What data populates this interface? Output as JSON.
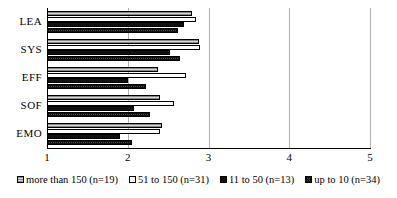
{
  "chart_data": {
    "type": "bar",
    "orientation": "horizontal",
    "title": "",
    "xlabel": "",
    "ylabel": "",
    "xlim": [
      1,
      5
    ],
    "xticks": [
      "1",
      "2",
      "3",
      "4",
      "5"
    ],
    "grid": true,
    "legend_position": "bottom",
    "categories": [
      "LEA",
      "SYS",
      "EFF",
      "SOF",
      "EMO"
    ],
    "series": [
      {
        "name": "more than 150 (n=19)",
        "pattern": "light-grey-hatch",
        "values": [
          2.8,
          2.88,
          2.38,
          2.4,
          2.42
        ]
      },
      {
        "name": "51 to 150 (n=31)",
        "pattern": "white",
        "values": [
          2.85,
          2.9,
          2.72,
          2.57,
          2.4
        ]
      },
      {
        "name": "11 to 50 (n=13)",
        "pattern": "solid-black",
        "values": [
          2.7,
          2.52,
          2.0,
          2.08,
          1.9
        ]
      },
      {
        "name": "up to 10 (n=34)",
        "pattern": "dark-checker",
        "values": [
          2.62,
          2.65,
          2.22,
          2.27,
          2.05
        ]
      }
    ]
  },
  "legend": {
    "items": [
      {
        "label": "more than 150 (n=19)"
      },
      {
        "label": "51 to 150 (n=31)"
      },
      {
        "label": "11 to 50 (n=13)"
      },
      {
        "label": "up to 10 (n=34)"
      }
    ]
  }
}
